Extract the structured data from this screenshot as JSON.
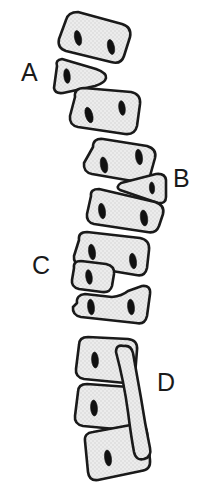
{
  "figure": {
    "background_color": "#ffffff",
    "bone_fill_color": "#e9e9e9",
    "bone_outline_color": "#1a1a1a",
    "foramen_color": "#111111"
  },
  "labels": [
    {
      "id": "A",
      "text": "A",
      "side": "left"
    },
    {
      "id": "B",
      "text": "B",
      "side": "right"
    },
    {
      "id": "C",
      "text": "C",
      "side": "left"
    },
    {
      "id": "D",
      "text": "D",
      "side": "right"
    }
  ],
  "segments": [
    {
      "index": 1,
      "name": "vertebra-1",
      "shape": "rounded-block",
      "foramina": 2
    },
    {
      "index": 2,
      "name": "vertebra-2",
      "shape": "wedge-right",
      "foramina": 1
    },
    {
      "index": 3,
      "name": "vertebra-3",
      "shape": "rounded-block",
      "foramina": 2
    },
    {
      "index": 4,
      "name": "vertebra-4",
      "shape": "rounded-block",
      "foramina": 2
    },
    {
      "index": 5,
      "name": "vertebra-5",
      "shape": "wedge-left",
      "foramina": 1
    },
    {
      "index": 6,
      "name": "vertebra-6",
      "shape": "rounded-block",
      "foramina": 2
    },
    {
      "index": 7,
      "name": "vertebra-7",
      "shape": "rounded-block",
      "foramina": 2
    },
    {
      "index": 8,
      "name": "vertebra-8",
      "shape": "wedge-left",
      "foramina": 1
    },
    {
      "index": 9,
      "name": "vertebra-9",
      "shape": "rounded-block",
      "foramina": 2
    },
    {
      "index": 10,
      "name": "vertebra-10",
      "shape": "rounded-block",
      "foramina": 1
    },
    {
      "index": 11,
      "name": "vertebra-11",
      "shape": "rounded-block",
      "foramina": 1
    },
    {
      "index": 12,
      "name": "vertebra-12",
      "shape": "rounded-block",
      "foramina": 1
    },
    {
      "index": 13,
      "name": "curved-bone",
      "shape": "long-curved-strut",
      "foramina": 0
    }
  ]
}
